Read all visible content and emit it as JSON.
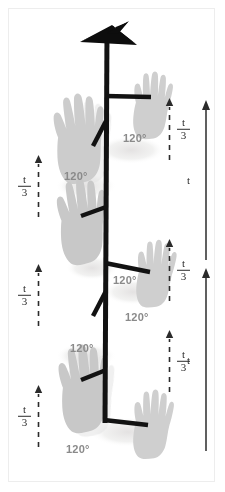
{
  "figure": {
    "background_color": "#ffffff",
    "border_color": "#ededed",
    "pole_color": "#111111",
    "hand_color": "#c9c9c9",
    "shadow_color": "#eceaea",
    "angle_text_color": "#8a8a8a",
    "tick_text_color": "#2b2b2b"
  },
  "angles": [
    {
      "label": "120°",
      "x": 123,
      "y": 139
    },
    {
      "label": "120°",
      "x": 64,
      "y": 177
    },
    {
      "label": "120°",
      "x": 113,
      "y": 281
    },
    {
      "label": "120°",
      "x": 125,
      "y": 318
    },
    {
      "label": "120°",
      "x": 70,
      "y": 349
    },
    {
      "label": "120°",
      "x": 66,
      "y": 450
    }
  ],
  "left_ticks": [
    {
      "label_num": "t",
      "label_den": "3",
      "x": 18,
      "y": 155,
      "height": 62
    },
    {
      "label_num": "t",
      "label_den": "3",
      "x": 18,
      "y": 264,
      "height": 62
    },
    {
      "label_num": "t",
      "label_den": "3",
      "x": 18,
      "y": 385,
      "height": 62
    }
  ],
  "right_ticks": [
    {
      "label_num": "t",
      "label_den": "3",
      "x": 165,
      "y": 98,
      "height": 62
    },
    {
      "label_num": "t",
      "label_den": "3",
      "x": 165,
      "y": 239,
      "height": 62
    },
    {
      "label_num": "t",
      "label_den": "3",
      "x": 165,
      "y": 330,
      "height": 62
    }
  ],
  "long_arrows": [
    {
      "label": "t",
      "x": 200,
      "y": 100,
      "height": 160
    },
    {
      "label": "t",
      "x": 200,
      "y": 268,
      "height": 183
    }
  ],
  "hands": [
    {
      "side": "left",
      "x": 48,
      "y": 93,
      "w": 54,
      "h": 90,
      "rotate": -6
    },
    {
      "side": "right",
      "x": 133,
      "y": 68,
      "w": 40,
      "h": 68,
      "rotate": 2
    },
    {
      "side": "left",
      "x": 51,
      "y": 178,
      "w": 54,
      "h": 86,
      "rotate": -7
    },
    {
      "side": "right",
      "x": 137,
      "y": 236,
      "w": 40,
      "h": 68,
      "rotate": 3
    },
    {
      "side": "left",
      "x": 53,
      "y": 344,
      "w": 54,
      "h": 88,
      "rotate": -6
    },
    {
      "side": "right",
      "x": 133,
      "y": 386,
      "w": 40,
      "h": 70,
      "rotate": 2
    }
  ],
  "arms": [
    {
      "type": "horizontal-right",
      "x1": 106,
      "y1": 96,
      "x2": 151,
      "y2": 97
    },
    {
      "type": "diagonal-left",
      "x1": 105,
      "y1": 122,
      "x2": 94,
      "y2": 144
    },
    {
      "type": "horizontal-right",
      "x1": 106,
      "y1": 264,
      "x2": 150,
      "y2": 272
    },
    {
      "type": "diagonal-left",
      "x1": 105,
      "y1": 292,
      "x2": 94,
      "y2": 314
    },
    {
      "type": "horizontal-left",
      "x1": 106,
      "y1": 207,
      "x2": 82,
      "y2": 216
    },
    {
      "type": "horizontal-left",
      "x1": 106,
      "y1": 370,
      "x2": 82,
      "y2": 380
    },
    {
      "type": "horizontal-right",
      "x1": 104,
      "y1": 420,
      "x2": 148,
      "y2": 424
    }
  ],
  "pole": {
    "x": 106,
    "top": 44,
    "bottom": 424,
    "width": 5
  },
  "finial": {
    "shape": "arrowhead",
    "cx": 107,
    "cy": 35
  }
}
